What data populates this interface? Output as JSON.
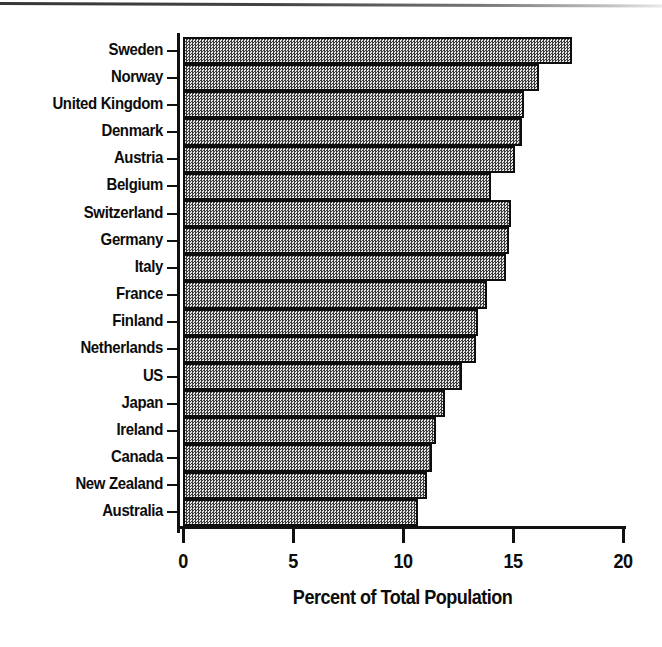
{
  "chart_data": {
    "type": "bar",
    "orientation": "horizontal",
    "title": "",
    "xlabel": "Percent of Total Population",
    "ylabel": "",
    "xlim": [
      0,
      20
    ],
    "xticks": [
      "0",
      "5",
      "10",
      "15",
      "20"
    ],
    "xtick_values": [
      0,
      5,
      10,
      15,
      20
    ],
    "grid": false,
    "legend": null,
    "categories": [
      "Sweden",
      "Norway",
      "United Kingdom",
      "Denmark",
      "Austria",
      "Belgium",
      "Switzerland",
      "Germany",
      "Italy",
      "France",
      "Finland",
      "Netherlands",
      "US",
      "Japan",
      "Ireland",
      "Canada",
      "New Zealand",
      "Australia"
    ],
    "values": [
      17.7,
      16.2,
      15.5,
      15.4,
      15.1,
      14.0,
      14.9,
      14.8,
      14.7,
      13.8,
      13.4,
      13.3,
      12.7,
      11.9,
      11.5,
      11.3,
      11.1,
      10.7
    ]
  },
  "style": {
    "bar_fill": "#b4b4b4",
    "bar_edge": "#0d0d0d",
    "axis_color": "#111111",
    "text_color": "#0c0c0c",
    "background": "#ffffff"
  }
}
